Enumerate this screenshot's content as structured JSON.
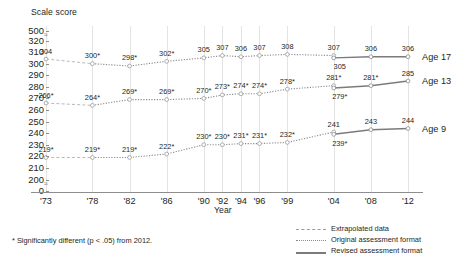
{
  "chart_data": {
    "type": "line",
    "title": "",
    "ylabel": "Scale score",
    "xlabel": "Year",
    "x": [
      "'73",
      "'78",
      "'82",
      "'86",
      "'90",
      "'92",
      "'94",
      "'96",
      "'99",
      "'04",
      "'08",
      "'12"
    ],
    "categories": [
      "'73",
      "'78",
      "'82",
      "'86",
      "'90",
      "'92",
      "'94",
      "'96",
      "'99",
      "'04",
      "'08",
      "'12"
    ],
    "yticks": [
      "500",
      "320",
      "310",
      "300",
      "290",
      "280",
      "270",
      "260",
      "250",
      "240",
      "230",
      "220",
      "210",
      "200",
      "0"
    ],
    "ylim": [
      200,
      320
    ],
    "grid": "vertical",
    "legend_position": "bottom-right",
    "series": [
      {
        "name": "Age 17",
        "label": "Age 17",
        "values": [
          304,
          300,
          298,
          302,
          305,
          307,
          306,
          307,
          308,
          307,
          306,
          306
        ],
        "labels": [
          "304",
          "300*",
          "298*",
          "302*",
          "305",
          "307",
          "306",
          "307",
          "308",
          "307",
          "306",
          "306"
        ],
        "revised_values": [
          305,
          306,
          306
        ],
        "revised_labels": [
          "305",
          "306",
          "306"
        ],
        "extrapolated_to_index": 1
      },
      {
        "name": "Age 13",
        "label": "Age 13",
        "values": [
          266,
          264,
          269,
          269,
          270,
          273,
          274,
          274,
          278,
          281,
          281,
          285
        ],
        "labels": [
          "266*",
          "264*",
          "269*",
          "269*",
          "270*",
          "273*",
          "274*",
          "274*",
          "278*",
          "281*",
          "281*",
          "285"
        ],
        "revised_values": [
          279,
          281,
          285
        ],
        "revised_labels": [
          "279*",
          "281*",
          "285"
        ],
        "extrapolated_to_index": 1
      },
      {
        "name": "Age 9",
        "label": "Age 9",
        "values": [
          219,
          219,
          219,
          222,
          230,
          230,
          231,
          231,
          232,
          241,
          243,
          244
        ],
        "labels": [
          "219*",
          "219*",
          "219*",
          "222*",
          "230*",
          "230*",
          "231*",
          "231*",
          "232*",
          "241",
          "243",
          "244"
        ],
        "revised_values": [
          239,
          243,
          244
        ],
        "revised_labels": [
          "239*",
          "243",
          "244"
        ],
        "extrapolated_to_index": 1
      }
    ],
    "legend": [
      {
        "label": "Extrapolated data",
        "style": "dashed"
      },
      {
        "label": "Original assessment format",
        "style": "dotted"
      },
      {
        "label": "Revised assessment format",
        "style": "solid"
      }
    ],
    "footnote": "* Significantly different (p < .05) from 2012."
  }
}
